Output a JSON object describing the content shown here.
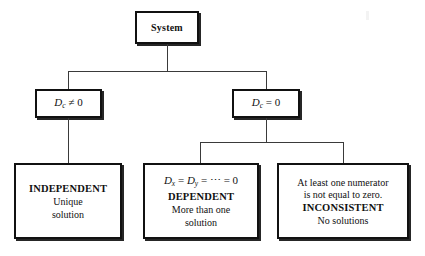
{
  "diagram": {
    "background_color": "#ffffff",
    "line_color": "#3a3a3a",
    "border_color": "#111111"
  },
  "root": {
    "label": "System"
  },
  "conditions": {
    "nonzero": {
      "symbol": "D",
      "subscript": "c",
      "operator": "≠",
      "value": "0"
    },
    "zero": {
      "symbol": "D",
      "subscript": "c",
      "operator": "=",
      "value": "0"
    }
  },
  "outcomes": {
    "independent": {
      "heading": "INDEPENDENT",
      "line1": "Unique",
      "line2": "solution"
    },
    "dependent": {
      "formula_sym1": "D",
      "formula_sub1": "x",
      "formula_op1": "=",
      "formula_sym2": "D",
      "formula_sub2": "y",
      "formula_op2": "=",
      "formula_ellipsis": "⋯",
      "formula_op3": "=",
      "formula_value": "0",
      "heading": "DEPENDENT",
      "line1": "More than one",
      "line2": "solution"
    },
    "inconsistent": {
      "line1": "At least one numerator",
      "line2": "is not equal to zero.",
      "heading": "INCONSISTENT",
      "line3": "No solutions"
    }
  }
}
